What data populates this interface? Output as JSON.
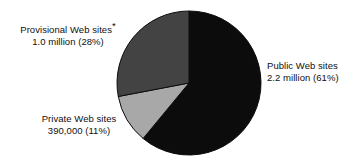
{
  "chart_data": {
    "type": "pie",
    "title": "",
    "subtitle": "",
    "xlabel": "",
    "ylabel": "",
    "legend_position": "callout-labels",
    "grid": false,
    "start_angle_deg": 0,
    "direction": "clockwise",
    "categories": [
      "Public Web sites",
      "Private Web sites",
      "Provisional Web sites"
    ],
    "values": [
      61,
      11,
      28
    ],
    "value_unit": "percent",
    "absolute_values": [
      2200000,
      390000,
      1000000
    ],
    "slices": [
      {
        "name": "Public Web sites",
        "percent": 61,
        "percent_label": "(61%)",
        "amount_label": "2.2 million",
        "value_line": "2.2 million (61%)",
        "color": "#0c0c0c",
        "footnote_marker": ""
      },
      {
        "name": "Private Web sites",
        "percent": 11,
        "percent_label": "(11%)",
        "amount_label": "390,000",
        "value_line": "390,000 (11%)",
        "color": "#a8a8a8",
        "footnote_marker": ""
      },
      {
        "name": "Provisional Web sites",
        "percent": 28,
        "percent_label": "(28%)",
        "amount_label": "1.0 million",
        "value_line": "1.0 million (28%)",
        "color": "#434343",
        "footnote_marker": "*"
      }
    ]
  },
  "labels": {
    "provisional": {
      "name": "Provisional Web sites",
      "footnote_marker": "*",
      "value": "1.0 million (28%)"
    },
    "public": {
      "name": "Public Web sites",
      "value": "2.2 million (61%)"
    },
    "private": {
      "name": "Private Web sites",
      "value": "390,000 (11%)"
    }
  },
  "colors": {
    "public_slice": "#0c0c0c",
    "private_slice": "#a8a8a8",
    "provisional_slice": "#434343",
    "outline": "#0c0c0c",
    "background": "#ffffff",
    "text": "#101010"
  }
}
